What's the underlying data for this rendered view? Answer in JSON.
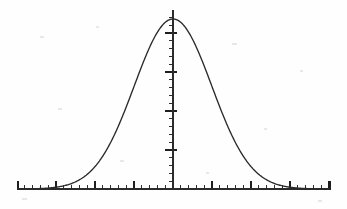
{
  "figure": {
    "background_color": "#fefefe",
    "line_color": "#2a2a2a",
    "axis_color": "#2b2b2b",
    "width_px": 347,
    "height_px": 209
  },
  "axes": {
    "x_axis_name": "horizontal-axis",
    "y_axis_name": "vertical-axis",
    "x_axis_y_px": 189,
    "x_axis_start_px": 18,
    "x_axis_end_px": 330,
    "y_axis_x_px": 173,
    "y_axis_top_px": 10,
    "minor_tick_spacing_px": 7.8,
    "major_tick_every_n_minor": 5,
    "minor_tick_length_px": 4,
    "major_tick_length_px": 8,
    "x_tick_labels": [],
    "y_tick_labels": [],
    "x_axis_label": "",
    "y_axis_label": ""
  },
  "chart_data": {
    "type": "line",
    "title": "",
    "subtitle": "",
    "xlabel": "",
    "ylabel": "",
    "grid": false,
    "legend": [],
    "legend_position": "none",
    "annotations": [],
    "distribution": "normal",
    "mean": 0,
    "std_dev": 1,
    "peak_value": 0.3989,
    "xlim": [
      -4,
      4
    ],
    "ylim": [
      0,
      0.42
    ],
    "x": [
      -4,
      -3.8,
      -3.6,
      -3.4,
      -3.2,
      -3,
      -2.8,
      -2.6,
      -2.4,
      -2.2,
      -2,
      -1.8,
      -1.6,
      -1.4,
      -1.2,
      -1,
      -0.8,
      -0.6,
      -0.4,
      -0.2,
      0,
      0.2,
      0.4,
      0.6,
      0.8,
      1,
      1.2,
      1.4,
      1.6,
      1.8,
      2,
      2.2,
      2.4,
      2.6,
      2.8,
      3,
      3.2,
      3.4,
      3.6,
      3.8,
      4
    ],
    "values": [
      0.0001,
      0.0003,
      0.0006,
      0.0012,
      0.0024,
      0.0044,
      0.0079,
      0.0136,
      0.0224,
      0.0355,
      0.054,
      0.079,
      0.1109,
      0.1497,
      0.1942,
      0.242,
      0.2897,
      0.3332,
      0.3683,
      0.391,
      0.3989,
      0.391,
      0.3683,
      0.3332,
      0.2897,
      0.242,
      0.1942,
      0.1497,
      0.1109,
      0.079,
      0.054,
      0.0355,
      0.0224,
      0.0136,
      0.0079,
      0.0044,
      0.0024,
      0.0012,
      0.0006,
      0.0003,
      0.0001
    ],
    "series": [
      {
        "name": "normal-pdf",
        "values": [
          0.0001,
          0.0003,
          0.0006,
          0.0012,
          0.0024,
          0.0044,
          0.0079,
          0.0136,
          0.0224,
          0.0355,
          0.054,
          0.079,
          0.1109,
          0.1497,
          0.1942,
          0.242,
          0.2897,
          0.3332,
          0.3683,
          0.391,
          0.3989,
          0.391,
          0.3683,
          0.3332,
          0.2897,
          0.242,
          0.1942,
          0.1497,
          0.1109,
          0.079,
          0.054,
          0.0355,
          0.0224,
          0.0136,
          0.0079,
          0.0044,
          0.0024,
          0.0012,
          0.0006,
          0.0003,
          0.0001
        ]
      }
    ]
  }
}
